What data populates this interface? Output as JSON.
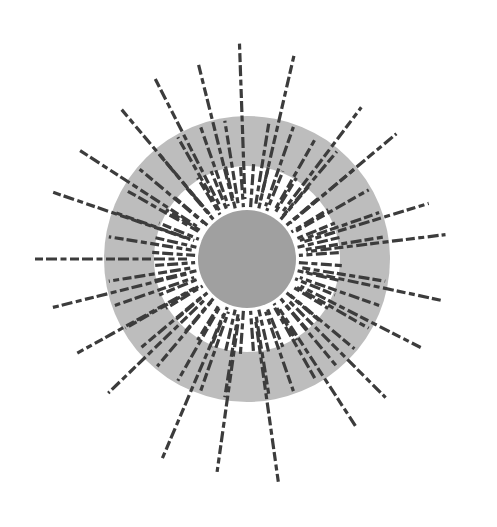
{
  "figure": {
    "title": "",
    "width": 497,
    "height": 527,
    "background": "#ffffff"
  },
  "geometry": {
    "center": [
      247,
      259
    ],
    "outer_ring": {
      "radius": 143,
      "color": "#bdbdbd"
    },
    "white_band": {
      "radius": 93,
      "color": "#ffffff"
    },
    "inner_disc": {
      "radius": 49,
      "color": "#a0a0a0"
    }
  },
  "rays": {
    "color": "#3c3c3c",
    "stroke_width": 3.2,
    "dash_pattern": "9 3.5 6 3.5 11 3",
    "start_radius": 52,
    "gap_half_width_deg": 4,
    "fan_count": 4,
    "fan_span_deg": 82,
    "long_rays": [
      {
        "angle": -104,
        "length": 200
      },
      {
        "angle": -92,
        "length": 218
      },
      {
        "angle": -77,
        "length": 212
      },
      {
        "angle": -53,
        "length": 190
      },
      {
        "angle": -40,
        "length": 195
      },
      {
        "angle": -17,
        "length": 190
      },
      {
        "angle": -7,
        "length": 200
      },
      {
        "angle": 12,
        "length": 198
      },
      {
        "angle": 27,
        "length": 195
      },
      {
        "angle": 45,
        "length": 196
      },
      {
        "angle": 57,
        "length": 200
      },
      {
        "angle": 82,
        "length": 225
      },
      {
        "angle": 98,
        "length": 215
      },
      {
        "angle": 113,
        "length": 218
      },
      {
        "angle": 136,
        "length": 193
      },
      {
        "angle": 151,
        "length": 194
      },
      {
        "angle": 166,
        "length": 200
      },
      {
        "angle": 180,
        "length": 212
      },
      {
        "angle": 199,
        "length": 205
      },
      {
        "angle": 213,
        "length": 200
      },
      {
        "angle": 230,
        "length": 195
      },
      {
        "angle": 243,
        "length": 205
      }
    ],
    "mid_ring_end_radius": 140,
    "inner_ring_end_radius": 95,
    "rays_per_fan_mid": 8,
    "rays_per_fan_inner": 10
  }
}
